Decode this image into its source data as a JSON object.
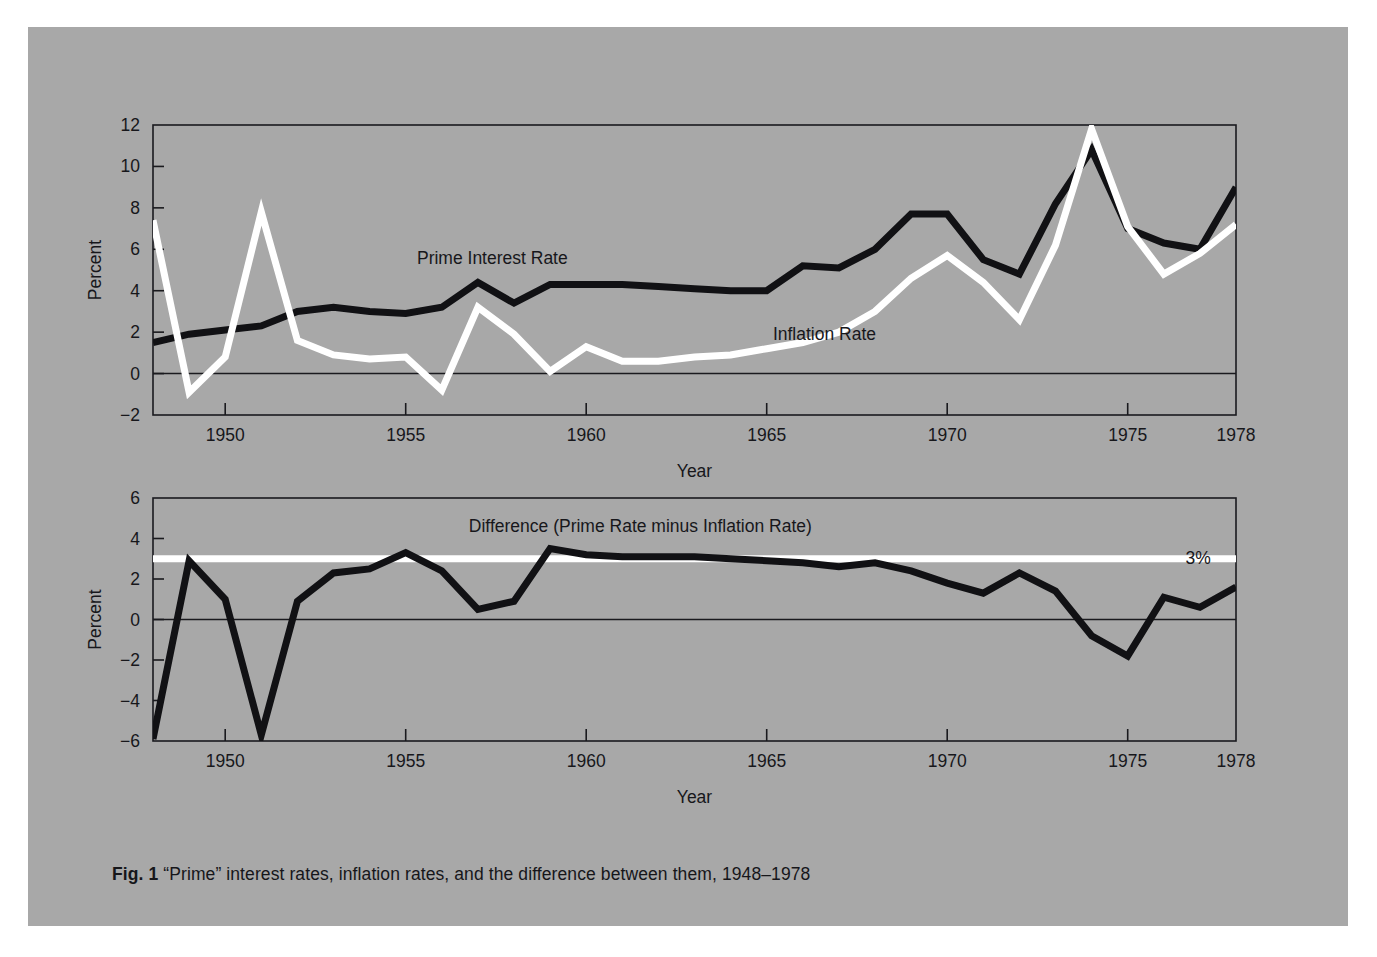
{
  "figure": {
    "caption_label": "Fig. 1",
    "caption_text": "“Prime” interest rates, inflation rates, and the difference between them, 1948–1978",
    "panel_background": "#a8a8a8",
    "page_background": "#ffffff",
    "line_color_dark": "#111114",
    "line_color_light": "#ffffff",
    "axis_color": "#1a1a1e"
  },
  "chart_data": [
    {
      "id": "top-panel",
      "type": "line",
      "title": "",
      "xlabel": "Year",
      "ylabel": "Percent",
      "xlim": [
        1948,
        1978
      ],
      "ylim": [
        -2,
        12
      ],
      "xticks": [
        1950,
        1955,
        1960,
        1965,
        1970,
        1975,
        1978
      ],
      "xtick_labels": [
        "1950",
        "1955",
        "1960",
        "1965",
        "1970",
        "1975",
        "1978"
      ],
      "yticks": [
        -2,
        0,
        2,
        4,
        6,
        8,
        10,
        12
      ],
      "ytick_labels": [
        "−2",
        "0",
        "2",
        "4",
        "6",
        "8",
        "10",
        "12"
      ],
      "grid": false,
      "zero_line": true,
      "legend": "inline-annotations",
      "x": [
        1948,
        1949,
        1950,
        1951,
        1952,
        1953,
        1954,
        1955,
        1956,
        1957,
        1958,
        1959,
        1960,
        1961,
        1962,
        1963,
        1964,
        1965,
        1966,
        1967,
        1968,
        1969,
        1970,
        1971,
        1972,
        1973,
        1974,
        1975,
        1976,
        1977,
        1978
      ],
      "series": [
        {
          "name": "Prime Interest Rate",
          "color": "#111114",
          "label_x": 1957.4,
          "label_y": 5.3,
          "values": [
            1.5,
            1.9,
            2.1,
            2.3,
            3.0,
            3.2,
            3.0,
            2.9,
            3.2,
            4.4,
            3.4,
            4.3,
            4.3,
            4.3,
            4.2,
            4.1,
            4.0,
            4.0,
            5.2,
            5.1,
            6.0,
            7.7,
            7.7,
            5.5,
            4.8,
            8.2,
            10.8,
            7.0,
            6.3,
            6.0,
            9.0
          ]
        },
        {
          "name": "Inflation Rate",
          "color": "#ffffff",
          "label_x": 1966.6,
          "label_y": 1.6,
          "values": [
            7.4,
            -0.9,
            0.8,
            7.8,
            1.6,
            0.9,
            0.7,
            0.8,
            -0.8,
            3.2,
            1.9,
            0.1,
            1.3,
            0.6,
            0.6,
            0.8,
            0.9,
            1.2,
            1.5,
            2.0,
            3.0,
            4.6,
            5.7,
            4.4,
            2.6,
            6.2,
            11.8,
            7.1,
            4.8,
            5.8,
            7.2
          ]
        }
      ]
    },
    {
      "id": "bottom-panel",
      "type": "line",
      "title": "",
      "xlabel": "Year",
      "ylabel": "Percent",
      "xlim": [
        1948,
        1978
      ],
      "ylim": [
        -6,
        6
      ],
      "xticks": [
        1950,
        1955,
        1960,
        1965,
        1970,
        1975,
        1978
      ],
      "xtick_labels": [
        "1950",
        "1955",
        "1960",
        "1965",
        "1970",
        "1975",
        "1978"
      ],
      "yticks": [
        -6,
        -4,
        -2,
        0,
        2,
        4,
        6
      ],
      "ytick_labels": [
        "−6",
        "−4",
        "−2",
        "0",
        "2",
        "4",
        "6"
      ],
      "grid": false,
      "zero_line": true,
      "legend": "inline-annotations",
      "x": [
        1948,
        1949,
        1950,
        1951,
        1952,
        1953,
        1954,
        1955,
        1956,
        1957,
        1958,
        1959,
        1960,
        1961,
        1962,
        1963,
        1964,
        1965,
        1966,
        1967,
        1968,
        1969,
        1970,
        1971,
        1972,
        1973,
        1974,
        1975,
        1976,
        1977,
        1978
      ],
      "series": [
        {
          "name": "Difference (Prime Rate minus Inflation Rate)",
          "color": "#111114",
          "label_x": 1961.5,
          "label_y": 4.3,
          "values": [
            -5.9,
            2.9,
            1.0,
            -5.7,
            0.9,
            2.3,
            2.5,
            3.3,
            2.4,
            0.5,
            0.9,
            3.5,
            3.2,
            3.1,
            3.1,
            3.1,
            3.0,
            2.9,
            2.8,
            2.6,
            2.8,
            2.4,
            1.8,
            1.3,
            2.3,
            1.4,
            -0.8,
            -1.8,
            1.1,
            0.6,
            1.6
          ]
        }
      ],
      "reference_line": {
        "name": "3% reference",
        "label": "3%",
        "value": 3.0,
        "color": "#ffffff",
        "label_x": 1976.6
      }
    }
  ]
}
